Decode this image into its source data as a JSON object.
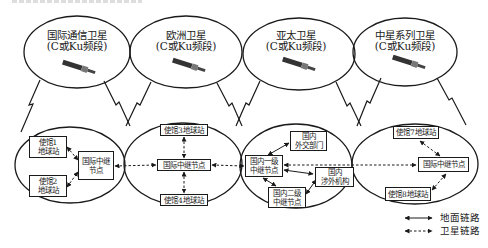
{
  "diagram": {
    "type": "network-topology",
    "satellites": [
      {
        "id": "sat1",
        "name": "国际通信卫星",
        "band": "(C或Ku频段)"
      },
      {
        "id": "sat2",
        "name": "欧洲卫星",
        "band": "(C或Ku频段)"
      },
      {
        "id": "sat3",
        "name": "亚太卫星",
        "band": "(C或Ku频段)"
      },
      {
        "id": "sat4",
        "name": "中星系列卫星",
        "band": "(C或Ku频段)"
      }
    ],
    "regions": [
      {
        "id": "region1",
        "nodes": [
          {
            "id": "emb1",
            "label": "使馆1\n地球站"
          },
          {
            "id": "emb2",
            "label": "使馆2\n地球站"
          },
          {
            "id": "relay1",
            "label": "国际中继\n节点"
          }
        ]
      },
      {
        "id": "region2",
        "nodes": [
          {
            "id": "emb3",
            "label": "使馆3地球站"
          },
          {
            "id": "relay2",
            "label": "国际中继节点"
          },
          {
            "id": "emb4",
            "label": "使馆4地球站"
          }
        ]
      },
      {
        "id": "region3",
        "nodes": [
          {
            "id": "dom1",
            "label": "国内一级\n中继节点"
          },
          {
            "id": "mfa",
            "label": "国内\n外交部门"
          },
          {
            "id": "foreign",
            "label": "国内\n涉外机构"
          },
          {
            "id": "dom2",
            "label": "国内二级\n中继节点"
          }
        ]
      },
      {
        "id": "region4",
        "nodes": [
          {
            "id": "emb7",
            "label": "使馆7地球站"
          },
          {
            "id": "relay4",
            "label": "国际中继节点"
          },
          {
            "id": "emb8",
            "label": "使馆8地球站"
          }
        ]
      }
    ],
    "edges": [
      {
        "from": "emb1",
        "to": "relay1",
        "type": "satellite"
      },
      {
        "from": "emb2",
        "to": "relay1",
        "type": "satellite"
      },
      {
        "from": "relay1",
        "to": "relay2",
        "type": "satellite"
      },
      {
        "from": "emb3",
        "to": "relay2",
        "type": "satellite"
      },
      {
        "from": "emb4",
        "to": "relay2",
        "type": "satellite"
      },
      {
        "from": "relay2",
        "to": "dom1",
        "type": "satellite"
      },
      {
        "from": "dom1",
        "to": "relay4",
        "type": "satellite"
      },
      {
        "from": "dom1",
        "to": "mfa",
        "type": "ground"
      },
      {
        "from": "dom1",
        "to": "foreign",
        "type": "ground"
      },
      {
        "from": "dom1",
        "to": "dom2",
        "type": "ground"
      },
      {
        "from": "dom2",
        "to": "foreign",
        "type": "ground"
      },
      {
        "from": "emb7",
        "to": "relay4",
        "type": "satellite"
      },
      {
        "from": "emb8",
        "to": "relay4",
        "type": "satellite"
      }
    ],
    "legend": [
      {
        "type": "ground",
        "label": "地面链路"
      },
      {
        "type": "satellite",
        "label": "卫星链路"
      }
    ]
  },
  "colors": {
    "line": "#1a1a1a",
    "background": "#ffffff"
  }
}
